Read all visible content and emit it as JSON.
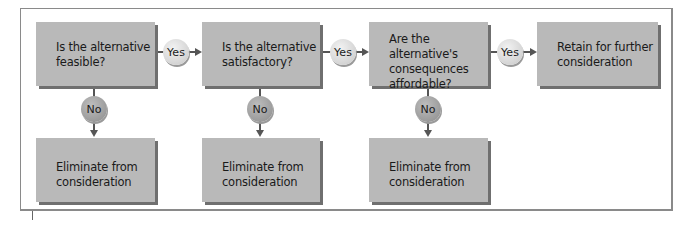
{
  "diagram": {
    "decisions": [
      {
        "label": "Is the alternative\nfeasible?"
      },
      {
        "label": "Is the alternative\nsatisfactory?"
      },
      {
        "label": "Are the alternative's\nconsequences\naffordable?"
      }
    ],
    "outcome": {
      "label": "Retain for further\nconsideration"
    },
    "eliminations": [
      {
        "label": "Eliminate from\nconsideration"
      },
      {
        "label": "Eliminate from\nconsideration"
      },
      {
        "label": "Eliminate from\nconsideration"
      }
    ],
    "yes_labels": [
      "Yes",
      "Yes",
      "Yes"
    ],
    "no_labels": [
      "No",
      "No",
      "No"
    ],
    "colors": {
      "box": "#b9b9b9",
      "box_shadow": "#6f6f6f",
      "yes_circle": "#dcdcdc",
      "no_circle": "#a0a0a0",
      "line": "#555555"
    }
  }
}
